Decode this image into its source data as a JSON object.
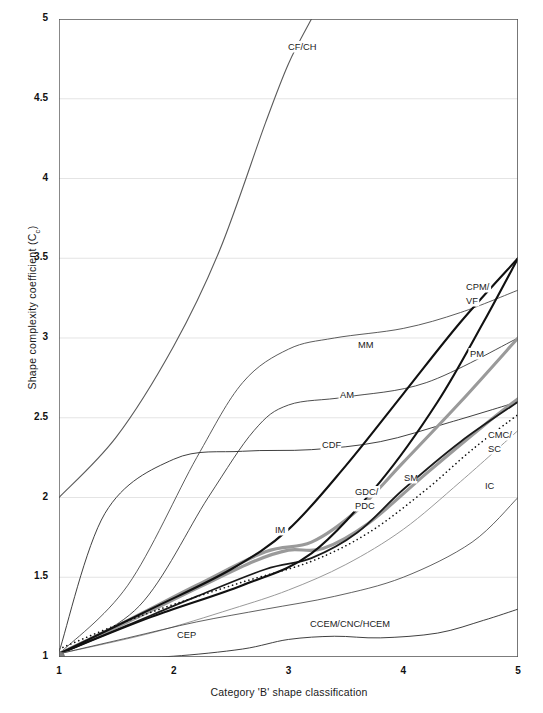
{
  "chart_data": {
    "type": "line",
    "title": "",
    "xlabel": "Category 'B' shape classification",
    "ylabel": "Shape complexity coefficient (Cc)",
    "ylabel_main": "Shape complexity coefficient (C",
    "ylabel_sub": "c",
    "ylabel_tail": ")",
    "xlim": [
      1,
      5
    ],
    "ylim": [
      1,
      5
    ],
    "grid": "horizontal-major",
    "legend": "inline-curve-labels",
    "xticks": [
      "1",
      "2",
      "3",
      "4",
      "5"
    ],
    "yticks": [
      "1",
      "1.5",
      "2",
      "2.5",
      "3",
      "3.5",
      "4",
      "4.5",
      "5"
    ],
    "origin_marker": {
      "label": "CM",
      "x": 1,
      "y": 1,
      "color": "#808080"
    },
    "series": [
      {
        "name": "CF/CH",
        "label": "CF/CH",
        "color": "#5a5a5a",
        "width": 1.1,
        "dash": "none",
        "x": [
          1.0,
          1.5,
          2.0,
          2.4,
          2.8,
          3.0,
          3.2
        ],
        "y": [
          2.0,
          2.38,
          2.95,
          3.55,
          4.35,
          4.72,
          5.0
        ]
      },
      {
        "name": "MM",
        "label": "MM",
        "color": "#4a4a4a",
        "width": 0.9,
        "dash": "none",
        "x": [
          1.0,
          1.6,
          2.2,
          2.6,
          3.0,
          3.4,
          4.0,
          4.5,
          5.0
        ],
        "y": [
          1.02,
          1.45,
          2.25,
          2.72,
          2.93,
          3.0,
          3.06,
          3.16,
          3.3
        ]
      },
      {
        "name": "AM",
        "label": "AM",
        "color": "#3a3a3a",
        "width": 0.9,
        "dash": "none",
        "x": [
          1.0,
          1.7,
          2.3,
          2.7,
          3.0,
          3.5,
          4.2,
          5.0
        ],
        "y": [
          1.02,
          1.32,
          2.0,
          2.42,
          2.58,
          2.63,
          2.72,
          3.0
        ]
      },
      {
        "name": "CDF",
        "label": "CDF",
        "color": "#2a2a2a",
        "width": 0.9,
        "dash": "none",
        "x": [
          1.0,
          1.4,
          2.0,
          2.6,
          3.2,
          3.8,
          4.4,
          5.0
        ],
        "y": [
          1.03,
          1.9,
          2.24,
          2.29,
          2.3,
          2.35,
          2.47,
          2.6
        ]
      },
      {
        "name": "GDC/PDC",
        "label": "GDC/\nPDC",
        "color": "#9a9a9a",
        "width": 3.1,
        "dash": "none",
        "x": [
          1.0,
          1.6,
          2.2,
          2.8,
          3.2,
          3.6,
          4.0,
          4.5,
          5.0
        ],
        "y": [
          1.02,
          1.23,
          1.45,
          1.66,
          1.72,
          1.92,
          2.22,
          2.6,
          3.0
        ]
      },
      {
        "name": "IM",
        "label": "IM",
        "color": "#9a9a9a",
        "width": 3.1,
        "dash": "none",
        "x": [
          1.0,
          1.6,
          2.2,
          2.7,
          3.0,
          3.3,
          3.7,
          4.2,
          4.7,
          5.0
        ],
        "y": [
          1.02,
          1.22,
          1.43,
          1.6,
          1.67,
          1.68,
          1.84,
          2.15,
          2.45,
          2.62
        ]
      },
      {
        "name": "SM",
        "label": "SM",
        "color": "#1a1a1a",
        "width": 1.8,
        "dash": "none",
        "x": [
          1.0,
          1.6,
          2.2,
          2.8,
          3.2,
          3.6,
          4.0,
          4.5,
          5.0
        ],
        "y": [
          1.02,
          1.2,
          1.38,
          1.55,
          1.62,
          1.78,
          2.05,
          2.35,
          2.6
        ]
      },
      {
        "name": "CPM/VF",
        "label": "CPM/\nVF",
        "color": "#111111",
        "width": 2.1,
        "dash": "none",
        "x": [
          1.0,
          1.8,
          2.5,
          3.0,
          3.5,
          4.0,
          4.5,
          5.0
        ],
        "y": [
          1.02,
          1.3,
          1.55,
          1.8,
          2.2,
          2.65,
          3.1,
          3.5
        ]
      },
      {
        "name": "PM",
        "label": "PM",
        "color": "#111111",
        "width": 2.1,
        "dash": "none",
        "x": [
          1.0,
          1.8,
          2.6,
          3.2,
          3.8,
          4.3,
          4.7,
          5.0
        ],
        "y": [
          1.02,
          1.25,
          1.45,
          1.65,
          2.1,
          2.6,
          3.1,
          3.5
        ]
      },
      {
        "name": "CMC/SC",
        "label": "CMC/\nSC",
        "color": "#111111",
        "width": 1.6,
        "dash": "dotted",
        "x": [
          1.0,
          1.5,
          2.0,
          2.6,
          3.2,
          3.7,
          4.2,
          4.6,
          5.0
        ],
        "y": [
          1.05,
          1.2,
          1.33,
          1.47,
          1.6,
          1.78,
          2.05,
          2.3,
          2.52
        ]
      },
      {
        "name": "IC",
        "label": "IC",
        "color": "#9a9a9a",
        "width": 1.0,
        "dash": "none",
        "x": [
          1.0,
          1.8,
          2.5,
          3.0,
          3.5,
          4.0,
          4.5,
          5.0
        ],
        "y": [
          1.02,
          1.15,
          1.3,
          1.42,
          1.58,
          1.8,
          2.1,
          2.42
        ]
      },
      {
        "name": "CEP",
        "label": "CEP",
        "color": "#3a3a3a",
        "width": 0.8,
        "dash": "none",
        "x": [
          1.0,
          1.6,
          2.2,
          2.8,
          3.4,
          4.0,
          4.6,
          5.0
        ],
        "y": [
          1.02,
          1.12,
          1.22,
          1.3,
          1.38,
          1.5,
          1.72,
          2.0
        ]
      },
      {
        "name": "CCEM/CNC/HCEM",
        "label": "CCEM/CNC/HCEM",
        "color": "#2a2a2a",
        "width": 0.9,
        "dash": "none",
        "x": [
          1.0,
          1.6,
          2.0,
          2.6,
          3.0,
          3.4,
          3.8,
          4.3,
          4.7,
          5.0
        ],
        "y": [
          1.0,
          1.0,
          1.005,
          1.05,
          1.11,
          1.13,
          1.12,
          1.15,
          1.23,
          1.3
        ]
      }
    ],
    "curve_labels": [
      {
        "text": "CF/CH",
        "x": 288,
        "y": 50
      },
      {
        "text": "MM",
        "x": 358,
        "y": 348
      },
      {
        "text": "AM",
        "x": 340,
        "y": 398
      },
      {
        "text": "CDF",
        "x": 322,
        "y": 448
      },
      {
        "text": "GDC/",
        "x": 355,
        "y": 495
      },
      {
        "text": "PDC",
        "x": 355,
        "y": 509
      },
      {
        "text": "SM",
        "x": 404,
        "y": 481
      },
      {
        "text": "IM",
        "x": 275,
        "y": 533
      },
      {
        "text": "CPM/",
        "x": 466,
        "y": 290
      },
      {
        "text": "VF",
        "x": 466,
        "y": 304
      },
      {
        "text": "PM",
        "x": 470,
        "y": 357
      },
      {
        "text": "CMC/",
        "x": 488,
        "y": 438
      },
      {
        "text": "SC",
        "x": 488,
        "y": 452
      },
      {
        "text": "IC",
        "x": 485,
        "y": 489
      },
      {
        "text": "CEP",
        "x": 177,
        "y": 638
      },
      {
        "text": "CCEM/CNC/HCEM",
        "x": 310,
        "y": 627
      },
      {
        "text": "CM",
        "x": 63,
        "y": 669
      }
    ]
  }
}
